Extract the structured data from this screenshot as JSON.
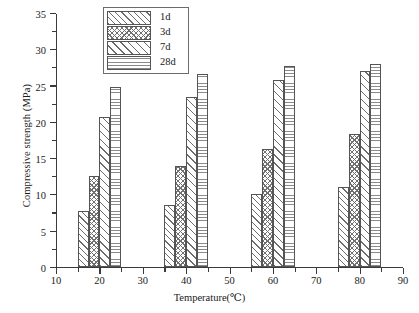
{
  "chart_data": {
    "type": "bar",
    "title": "",
    "xlabel": "Temperature(℃)",
    "ylabel": "Compressive strength (MPa)",
    "categories": [
      20,
      40,
      60,
      80
    ],
    "category_labels": [
      "20",
      "40",
      "60",
      "80"
    ],
    "series": [
      {
        "name": "1d",
        "values": [
          7.6,
          8.5,
          10.0,
          11.0
        ]
      },
      {
        "name": "3d",
        "values": [
          12.5,
          13.8,
          16.2,
          18.3
        ]
      },
      {
        "name": "7d",
        "values": [
          20.6,
          23.4,
          25.7,
          27.0
        ]
      },
      {
        "name": "28d",
        "values": [
          24.8,
          26.6,
          27.6,
          27.9
        ]
      }
    ],
    "xlim": [
      10,
      90
    ],
    "ylim": [
      0,
      35
    ],
    "xticks": [
      10,
      20,
      30,
      40,
      50,
      60,
      70,
      80,
      90
    ],
    "xtick_labels": [
      "10",
      "20",
      "30",
      "40",
      "50",
      "60",
      "70",
      "80",
      "90"
    ],
    "yticks": [
      0,
      5,
      10,
      15,
      20,
      25,
      30,
      35
    ],
    "ytick_labels": [
      "0",
      "5",
      "10",
      "15",
      "20",
      "25",
      "30",
      "35"
    ],
    "y_minor_ticks": [
      2.5,
      7.5,
      12.5,
      17.5,
      22.5,
      27.5,
      32.5
    ],
    "x_minor_ticks": [
      15,
      25,
      35,
      45,
      55,
      65,
      75,
      85
    ],
    "grid": false,
    "legend_position": "upper-left-inside",
    "bar_width_units": 2.5,
    "group_span_units": 10
  },
  "legend": {
    "entries": [
      {
        "label": "1d",
        "pattern": "diagonal-hatch"
      },
      {
        "label": "3d",
        "pattern": "cross-hatch"
      },
      {
        "label": "7d",
        "pattern": "diagonal-hatch-wide"
      },
      {
        "label": "28d",
        "pattern": "horizontal-lines"
      }
    ]
  },
  "colors": {
    "axis": "#3a3a3a",
    "hatch": "#6c6c6c",
    "background": "#ffffff",
    "text": "#1a1a1a"
  }
}
